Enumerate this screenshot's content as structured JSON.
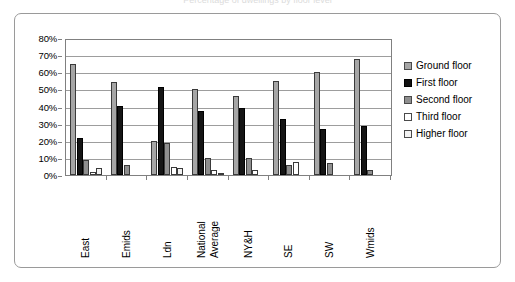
{
  "title_clipped": "Percentage of dwellings by floor level",
  "chart_data": {
    "type": "bar",
    "title": "",
    "xlabel": "",
    "ylabel": "",
    "ylim": [
      0,
      80
    ],
    "ytick_labels": [
      "80%",
      "70%",
      "60%",
      "50%",
      "40%",
      "30%",
      "20%",
      "10%",
      "0%"
    ],
    "ytick_values": [
      80,
      70,
      60,
      50,
      40,
      30,
      20,
      10,
      0
    ],
    "grid": true,
    "legend_position": "right",
    "categories": [
      "East",
      "Emids",
      "Ldn",
      "National Average",
      "NY&H",
      "SE",
      "SW",
      "Wmids"
    ],
    "category_lines": [
      [
        "East"
      ],
      [
        "Emids"
      ],
      [
        "Ldn"
      ],
      [
        "National",
        "Average"
      ],
      [
        "NY&H"
      ],
      [
        "SE"
      ],
      [
        "SW"
      ],
      [
        "Wmids"
      ]
    ],
    "series": [
      {
        "name": "Ground floor",
        "color": "#a6a6a6",
        "values": [
          66,
          55,
          20,
          51,
          47,
          56,
          61,
          69
        ]
      },
      {
        "name": "First floor",
        "color": "#151515",
        "values": [
          22,
          41,
          52,
          38,
          40,
          33,
          27,
          29
        ]
      },
      {
        "name": "Second floor",
        "color": "#8f8f8f",
        "values": [
          9,
          6,
          19,
          10,
          10,
          6,
          7,
          3
        ]
      },
      {
        "name": "Third floor",
        "color": "#ffffff",
        "values": [
          2,
          0,
          5,
          3,
          3,
          8,
          0,
          0
        ]
      },
      {
        "name": "Higher floor",
        "color": "#f2f2f2",
        "values": [
          4,
          0,
          4,
          1,
          0,
          0,
          0,
          0
        ]
      }
    ]
  },
  "legend": {
    "items": [
      {
        "label": "Ground floor",
        "swatch": "legend-swatch-ground-floor"
      },
      {
        "label": "First floor",
        "swatch": "legend-swatch-first-floor"
      },
      {
        "label": "Second floor",
        "swatch": "legend-swatch-second-floor"
      },
      {
        "label": "Third floor",
        "swatch": "legend-swatch-third-floor"
      },
      {
        "label": "Higher floor",
        "swatch": "legend-swatch-higher-floor"
      }
    ]
  },
  "colors": {
    "axis": "#808080",
    "grid": "#9d9d9d",
    "frame": "#9a9a9a",
    "background": "#ffffff"
  }
}
